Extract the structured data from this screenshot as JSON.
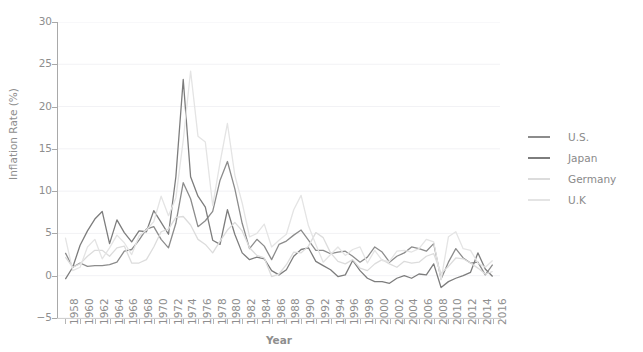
{
  "chart_data": {
    "type": "line",
    "title": "",
    "xlabel": "Year",
    "ylabel": "Inflation Rate (%)",
    "xlim": [
      1957,
      2017
    ],
    "ylim": [
      -5,
      30
    ],
    "yticks": [
      30,
      25,
      20,
      15,
      10,
      5,
      0,
      -5
    ],
    "ytick_labels": [
      "30",
      "25",
      "20",
      "15",
      "10",
      "5",
      "0",
      "−5"
    ],
    "xtick_labels": [
      "1958",
      "1960",
      "1962",
      "1964",
      "1966",
      "1968",
      "1970",
      "1972",
      "1974",
      "1976",
      "1978",
      "1980",
      "1982",
      "1984",
      "1986",
      "1988",
      "1990",
      "1992",
      "1994",
      "1996",
      "1998",
      "2000",
      "2002",
      "2004",
      "2006",
      "2008",
      "2010",
      "2012",
      "2014",
      "2016"
    ],
    "xtick_step": 2,
    "grid": true,
    "grid_axis": "y",
    "legend_position": "right",
    "x": [
      1958,
      1959,
      1960,
      1961,
      1962,
      1963,
      1964,
      1965,
      1966,
      1967,
      1968,
      1969,
      1970,
      1971,
      1972,
      1973,
      1974,
      1975,
      1976,
      1977,
      1978,
      1979,
      1980,
      1981,
      1982,
      1983,
      1984,
      1985,
      1986,
      1987,
      1988,
      1989,
      1990,
      1991,
      1992,
      1993,
      1994,
      1995,
      1996,
      1997,
      1998,
      1999,
      2000,
      2001,
      2002,
      2003,
      2004,
      2005,
      2006,
      2007,
      2008,
      2009,
      2010,
      2011,
      2012,
      2013,
      2014,
      2015,
      2016
    ],
    "series": [
      {
        "name": "U.S.",
        "color": "#8c8c8c",
        "values": [
          2.7,
          1.0,
          1.5,
          1.1,
          1.2,
          1.2,
          1.3,
          1.6,
          2.9,
          3.1,
          4.2,
          5.5,
          5.8,
          4.3,
          3.3,
          6.2,
          11.0,
          9.1,
          5.8,
          6.5,
          7.6,
          11.3,
          13.5,
          10.3,
          6.2,
          3.2,
          4.3,
          3.5,
          1.9,
          3.7,
          4.1,
          4.8,
          5.4,
          4.2,
          3.0,
          3.0,
          2.6,
          2.8,
          2.9,
          2.3,
          1.6,
          2.2,
          3.4,
          2.8,
          1.6,
          2.3,
          2.7,
          3.4,
          3.2,
          2.9,
          3.8,
          -0.4,
          1.6,
          3.2,
          2.1,
          1.5,
          1.6,
          0.1,
          1.3
        ]
      },
      {
        "name": "Japan",
        "color": "#7d7d7d",
        "values": [
          -0.4,
          1.0,
          3.6,
          5.3,
          6.7,
          7.6,
          3.8,
          6.6,
          5.1,
          4.0,
          5.3,
          5.2,
          7.7,
          6.3,
          4.9,
          11.7,
          23.2,
          11.7,
          9.4,
          8.1,
          4.2,
          3.7,
          7.8,
          4.9,
          2.7,
          1.9,
          2.2,
          2.0,
          0.6,
          0.1,
          0.7,
          2.3,
          3.1,
          3.3,
          1.7,
          1.2,
          0.7,
          -0.1,
          0.1,
          1.8,
          0.6,
          -0.3,
          -0.7,
          -0.7,
          -0.9,
          -0.3,
          0.0,
          -0.3,
          0.2,
          0.1,
          1.4,
          -1.4,
          -0.7,
          -0.3,
          0.0,
          0.4,
          2.7,
          0.8,
          -0.1
        ]
      },
      {
        "name": "Germany",
        "color": "#dcdcdc",
        "values": [
          2.2,
          1.0,
          1.4,
          2.3,
          3.0,
          3.0,
          2.3,
          3.3,
          3.5,
          1.5,
          1.5,
          1.9,
          3.4,
          5.2,
          5.5,
          6.9,
          7.0,
          6.0,
          4.3,
          3.7,
          2.7,
          4.1,
          5.4,
          6.3,
          5.3,
          3.3,
          2.4,
          2.1,
          -0.1,
          0.2,
          1.3,
          2.8,
          2.7,
          3.5,
          5.1,
          4.5,
          2.7,
          1.7,
          1.4,
          1.9,
          0.9,
          0.6,
          1.4,
          1.9,
          1.4,
          1.0,
          1.7,
          1.5,
          1.6,
          2.3,
          2.6,
          0.3,
          1.1,
          2.1,
          2.0,
          1.5,
          0.9,
          0.2,
          0.5
        ]
      },
      {
        "name": "U.K",
        "color": "#e4e4e4",
        "values": [
          4.5,
          0.6,
          1.0,
          3.4,
          4.3,
          2.0,
          3.3,
          4.8,
          3.9,
          2.5,
          4.7,
          5.4,
          6.4,
          9.4,
          7.1,
          9.2,
          16.0,
          24.2,
          16.5,
          15.8,
          8.3,
          13.4,
          18.0,
          11.9,
          8.6,
          4.6,
          5.0,
          6.1,
          3.4,
          4.2,
          4.9,
          7.8,
          9.5,
          5.9,
          3.7,
          1.6,
          2.5,
          3.4,
          2.4,
          3.1,
          3.4,
          1.5,
          3.0,
          1.8,
          1.7,
          2.9,
          3.0,
          2.8,
          3.2,
          4.3,
          4.0,
          -0.5,
          4.6,
          5.2,
          3.2,
          3.0,
          1.5,
          1.0,
          1.8
        ]
      }
    ]
  },
  "axes": {
    "y_title": "Inflation Rate (%)",
    "x_title": "Year"
  },
  "legend": {
    "items": [
      {
        "label": "U.S."
      },
      {
        "label": "Japan"
      },
      {
        "label": "Germany"
      },
      {
        "label": "U.K"
      }
    ]
  },
  "colors": {
    "axis": "#8e8e8e",
    "grid": "#f2f2f5",
    "background": "#ffffff"
  }
}
